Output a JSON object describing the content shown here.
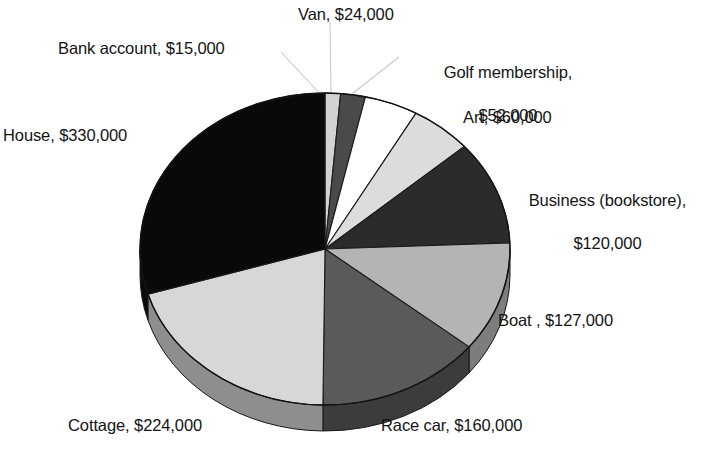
{
  "chart_data": {
    "type": "pie",
    "title": "",
    "three_d": true,
    "currency": "$",
    "total": 1112000,
    "legend_position": "none",
    "labels_outside": true,
    "categories": [
      "Bank account",
      "Van",
      "Golf membership",
      "Art",
      "Business (bookstore)",
      "Boat ",
      "Race car",
      "Cottage",
      "House"
    ],
    "values": [
      15000,
      24000,
      52000,
      60000,
      120000,
      127000,
      160000,
      224000,
      330000
    ],
    "slices": [
      {
        "name": "Bank account",
        "value": 15000,
        "label": "Bank account, $15,000",
        "fill": "#d2d2d2",
        "side": "#9a9a9a",
        "percent": 1.3
      },
      {
        "name": "Van",
        "value": 24000,
        "label": "Van, $24,000",
        "fill": "#4a4a4a",
        "side": "#333333",
        "percent": 2.2
      },
      {
        "name": "Golf membership",
        "value": 52000,
        "label": "Golf membership, $52,000",
        "fill": "#ffffff",
        "side": "#b8b8b8",
        "percent": 4.7
      },
      {
        "name": "Art",
        "value": 60000,
        "label": "Art, $60,000",
        "fill": "#dcdcdc",
        "side": "#9e9e9e",
        "percent": 5.4
      },
      {
        "name": "Business (bookstore)",
        "value": 120000,
        "label": "Business (bookstore), $120,000",
        "fill": "#2b2b2b",
        "side": "#1c1c1c",
        "percent": 10.8
      },
      {
        "name": "Boat",
        "value": 127000,
        "label": "Boat , $127,000",
        "fill": "#b4b4b4",
        "side": "#7d7d7d",
        "percent": 11.4
      },
      {
        "name": "Race car",
        "value": 160000,
        "label": "Race car, $160,000",
        "fill": "#5a5a5a",
        "side": "#3c3c3c",
        "percent": 14.4
      },
      {
        "name": "Cottage",
        "value": 224000,
        "label": "Cottage, $224,000",
        "fill": "#d7d7d7",
        "side": "#8e8e8e",
        "percent": 20.1
      },
      {
        "name": "House",
        "value": 330000,
        "label": "House, $330,000",
        "fill": "#090909",
        "side": "#0a0a0a",
        "percent": 29.7
      }
    ]
  },
  "labels": {
    "van": "Van, $24,000",
    "bank_account": "Bank account, $15,000",
    "golf_membership_line1": "Golf membership,",
    "golf_membership_line2": "$52,000",
    "art": "Art, $60,000",
    "business_line1": "Business (bookstore),",
    "business_line2": "$120,000",
    "house": "House, $330,000",
    "boat": "Boat , $127,000",
    "cottage": "Cottage, $224,000",
    "race_car": "Race car, $160,000"
  }
}
